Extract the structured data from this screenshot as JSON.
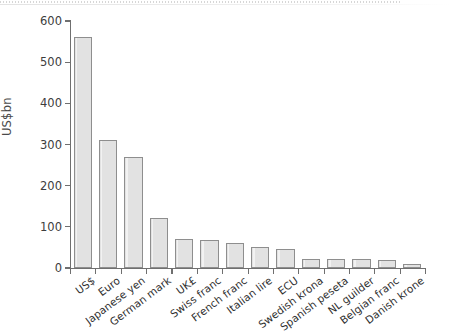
{
  "chart_data": {
    "type": "bar",
    "title": "",
    "subtitle": "",
    "xlabel": "",
    "ylabel": "US$bn",
    "ylim": [
      0,
      600
    ],
    "yticks": [
      0,
      100,
      200,
      300,
      400,
      500,
      600
    ],
    "ytick_labels": [
      "0",
      "100",
      "200",
      "300",
      "400",
      "500",
      "600"
    ],
    "grid": false,
    "legend": false,
    "bar_fill_color": "#e2e2e2",
    "bar_edge_color": "#8e8e8e",
    "axis_color": "#6f6f6f",
    "categories": [
      "US$",
      "Euro",
      "Japanese yen",
      "German mark",
      "UK£",
      "Swiss franc",
      "French franc",
      "Italian lire",
      "ECU",
      "Swedish krona",
      "Spanish peseta",
      "NL guilder",
      "Belgian franc",
      "Danish krone"
    ],
    "values": [
      560,
      312,
      270,
      122,
      71,
      67,
      60,
      50,
      47,
      23,
      22,
      21,
      20,
      10
    ]
  }
}
